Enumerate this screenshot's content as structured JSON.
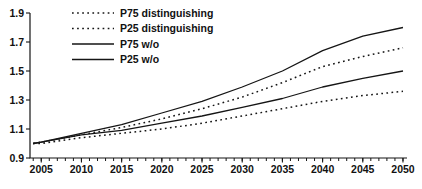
{
  "chart_data": {
    "type": "line",
    "title": "",
    "xlabel": "",
    "ylabel": "",
    "x": [
      2004,
      2005,
      2010,
      2015,
      2020,
      2025,
      2030,
      2035,
      2040,
      2045,
      2050
    ],
    "series": [
      {
        "name": "P75 distinguishing",
        "style": "dotted",
        "values": [
          1.0,
          1.01,
          1.06,
          1.11,
          1.17,
          1.24,
          1.32,
          1.42,
          1.53,
          1.6,
          1.66
        ]
      },
      {
        "name": "P25 distinguishing",
        "style": "dotted",
        "values": [
          1.0,
          1.0,
          1.04,
          1.07,
          1.1,
          1.14,
          1.19,
          1.24,
          1.29,
          1.33,
          1.36
        ]
      },
      {
        "name": "P75 w/o",
        "style": "solid",
        "values": [
          1.0,
          1.01,
          1.07,
          1.13,
          1.21,
          1.29,
          1.39,
          1.5,
          1.64,
          1.74,
          1.8
        ]
      },
      {
        "name": "P25 w/o",
        "style": "solid",
        "values": [
          1.0,
          1.01,
          1.06,
          1.09,
          1.14,
          1.19,
          1.25,
          1.31,
          1.39,
          1.45,
          1.5
        ]
      }
    ],
    "legend_order": [
      "P75 distinguishing",
      "P25 distinguishing",
      "P75 w/o",
      "P25 w/o"
    ],
    "legend_position": "top-left",
    "xlim": [
      2003.6,
      2050.5
    ],
    "ylim": [
      0.9,
      1.9
    ],
    "y_ticks": [
      "0.9",
      "1.1",
      "1.3",
      "1.5",
      "1.7",
      "1.9"
    ],
    "x_major_ticks": [
      2005,
      2010,
      2015,
      2020,
      2025,
      2030,
      2035,
      2040,
      2045,
      2050
    ],
    "x_minor_tick_interval": 1,
    "grid": false,
    "line_color": "#151515",
    "background": "#ffffff"
  }
}
